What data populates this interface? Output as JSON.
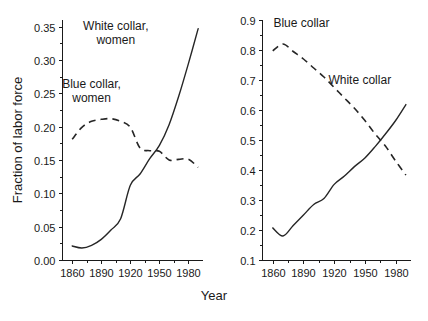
{
  "figure": {
    "shared_xlabel": "Year",
    "shared_ylabel": "Fraction of labor force",
    "background": "#ffffff",
    "ink_color": "#262626"
  },
  "chart_data": [
    {
      "type": "line",
      "id": "left-panel",
      "title": "",
      "xlabel": "Year",
      "ylabel": "Fraction of labor force",
      "xlim": [
        1850,
        1995
      ],
      "ylim": [
        0.0,
        0.36
      ],
      "xticks": [
        1860,
        1890,
        1920,
        1950,
        1980
      ],
      "xtick_labels": [
        "1860",
        "1890",
        "1920",
        "1950",
        "1980"
      ],
      "yticks": [
        0.0,
        0.05,
        0.1,
        0.15,
        0.2,
        0.25,
        0.3,
        0.35
      ],
      "ytick_labels": [
        "0.00",
        "0.05",
        "0.10",
        "0.15",
        "0.20",
        "0.25",
        "0.30",
        "0.35"
      ],
      "minor_ytick_step": 0.025,
      "minor_xtick_step": 15,
      "grid": false,
      "legend_position": "inline-annotations",
      "series": [
        {
          "name": "White collar, women",
          "style": "solid",
          "label_x": 1905,
          "label_y": 0.345,
          "x": [
            1860,
            1870,
            1880,
            1890,
            1900,
            1910,
            1920,
            1930,
            1940,
            1950,
            1960,
            1970,
            1980,
            1990
          ],
          "values": [
            0.021,
            0.018,
            0.022,
            0.031,
            0.045,
            0.062,
            0.112,
            0.129,
            0.152,
            0.172,
            0.203,
            0.246,
            0.295,
            0.347
          ]
        },
        {
          "name": "Blue collar, women",
          "style": "dashed",
          "label_x": 1880,
          "label_y": 0.258,
          "x": [
            1860,
            1870,
            1880,
            1890,
            1900,
            1910,
            1920,
            1930,
            1940,
            1950,
            1960,
            1970,
            1980,
            1990
          ],
          "values": [
            0.181,
            0.199,
            0.208,
            0.211,
            0.212,
            0.208,
            0.199,
            0.168,
            0.164,
            0.163,
            0.15,
            0.151,
            0.151,
            0.139
          ]
        }
      ]
    },
    {
      "type": "line",
      "id": "right-panel",
      "title": "",
      "xlabel": "Year",
      "ylabel": "Fraction of labor force",
      "xlim": [
        1850,
        1995
      ],
      "ylim": [
        0.1,
        0.9
      ],
      "xticks": [
        1860,
        1890,
        1920,
        1950,
        1980
      ],
      "xtick_labels": [
        "1860",
        "1890",
        "1920",
        "1950",
        "1980"
      ],
      "yticks": [
        0.1,
        0.2,
        0.3,
        0.4,
        0.5,
        0.6,
        0.7,
        0.8,
        0.9
      ],
      "ytick_labels": [
        "0.1",
        "0.2",
        "0.3",
        "0.4",
        "0.5",
        "0.6",
        "0.7",
        "0.8",
        "0.9"
      ],
      "minor_ytick_step": 0.05,
      "minor_xtick_step": 15,
      "grid": false,
      "legend_position": "inline-annotations",
      "series": [
        {
          "name": "Blue collar",
          "style": "dashed",
          "label_x": 1888,
          "label_y": 0.878,
          "x": [
            1860,
            1870,
            1880,
            1890,
            1900,
            1910,
            1920,
            1930,
            1940,
            1950,
            1960,
            1970,
            1980,
            1990
          ],
          "values": [
            0.797,
            0.82,
            0.795,
            0.77,
            0.74,
            0.71,
            0.675,
            0.64,
            0.605,
            0.565,
            0.52,
            0.48,
            0.43,
            0.383
          ]
        },
        {
          "name": "White collar",
          "style": "solid",
          "label_x": 1945,
          "label_y": 0.688,
          "x": [
            1860,
            1870,
            1880,
            1890,
            1900,
            1910,
            1920,
            1930,
            1940,
            1950,
            1960,
            1970,
            1980,
            1990
          ],
          "values": [
            0.207,
            0.18,
            0.215,
            0.25,
            0.285,
            0.305,
            0.352,
            0.38,
            0.412,
            0.44,
            0.478,
            0.52,
            0.565,
            0.618
          ]
        }
      ]
    }
  ]
}
